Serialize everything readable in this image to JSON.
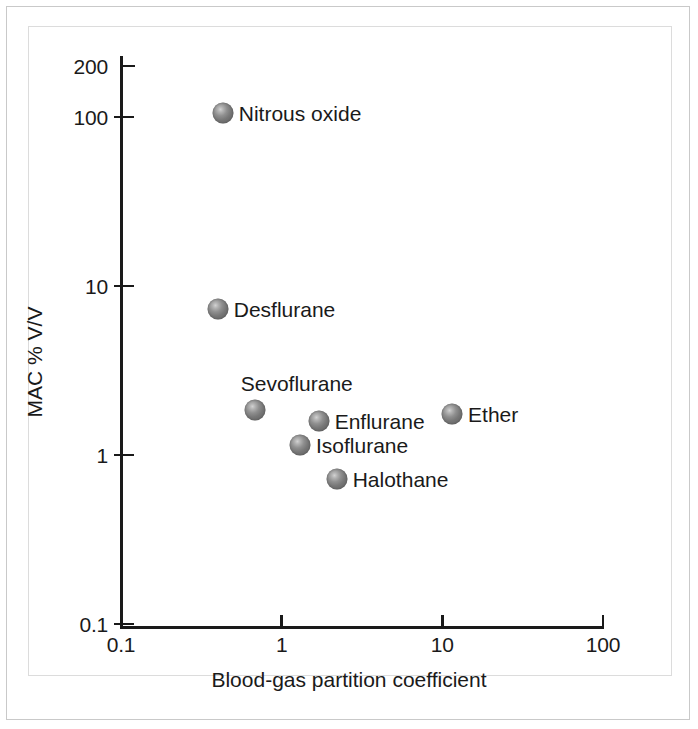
{
  "figure": {
    "background_color": "#ffffff",
    "frame_color": "#c9c9c9",
    "marker_color": "#767676",
    "axis_color": "#1a1a1a"
  },
  "chart_data": {
    "type": "scatter",
    "title": "",
    "xlabel": "Blood-gas partition coefficient",
    "ylabel": "MAC % V/V",
    "xscale": "log",
    "yscale": "log",
    "xlim": [
      0.1,
      100
    ],
    "ylim": [
      0.1,
      200
    ],
    "grid": false,
    "legend": "none (points labelled directly)",
    "xticks": [
      "0.1",
      "1",
      "10",
      "100"
    ],
    "xtick_values": [
      0.1,
      1,
      10,
      100
    ],
    "yticks": [
      "0.1",
      "1",
      "10",
      "100",
      "200"
    ],
    "ytick_values": [
      0.1,
      1,
      10,
      100,
      200
    ],
    "points": [
      {
        "label": "Nitrous oxide",
        "x": 0.43,
        "y": 105,
        "label_position": "right"
      },
      {
        "label": "Desflurane",
        "x": 0.4,
        "y": 7.3,
        "label_position": "right"
      },
      {
        "label": "Sevoflurane",
        "x": 0.68,
        "y": 1.85,
        "label_position": "above"
      },
      {
        "label": "Enflurane",
        "x": 1.7,
        "y": 1.6,
        "label_position": "right"
      },
      {
        "label": "Isoflurane",
        "x": 1.3,
        "y": 1.15,
        "label_position": "right"
      },
      {
        "label": "Halothane",
        "x": 2.2,
        "y": 0.72,
        "label_position": "right"
      },
      {
        "label": "Ether",
        "x": 11.5,
        "y": 1.75,
        "label_position": "right"
      }
    ]
  }
}
